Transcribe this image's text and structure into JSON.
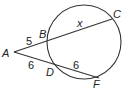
{
  "diagram": {
    "type": "circle-two-secants",
    "colors": {
      "stroke": "#333333",
      "text": "#222222",
      "background": "#ffffff"
    },
    "circle": {
      "cx": 84,
      "cy": 42,
      "r": 37
    },
    "points": {
      "A": {
        "label": "A",
        "x": 14,
        "y": 52
      },
      "B": {
        "label": "B",
        "x": 49,
        "y": 40
      },
      "C": {
        "label": "C",
        "x": 112,
        "y": 19
      },
      "D": {
        "label": "D",
        "x": 56,
        "y": 65
      },
      "F": {
        "label": "F",
        "x": 99,
        "y": 78
      }
    },
    "segments": {
      "AB": {
        "label": "5"
      },
      "BC": {
        "label": "x"
      },
      "AD": {
        "label": "6"
      },
      "DF": {
        "label": "6"
      }
    }
  }
}
